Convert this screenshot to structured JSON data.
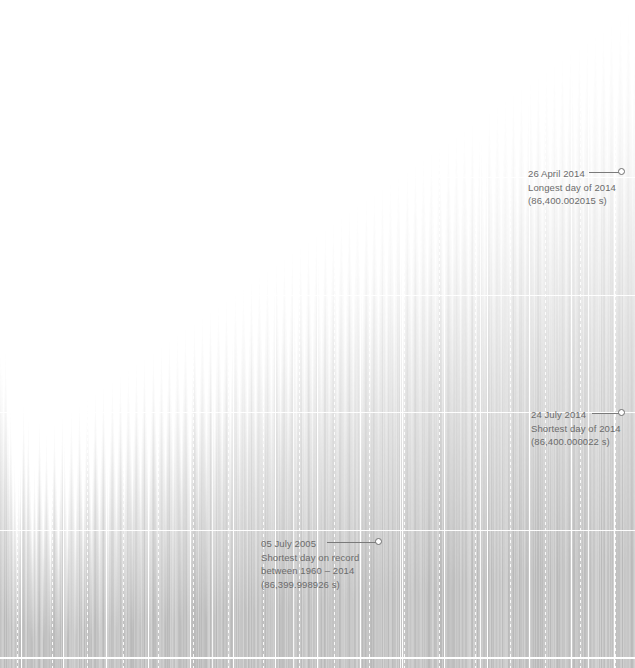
{
  "chart_data": {
    "type": "bar",
    "title": "",
    "subtitle": "",
    "xlabel": "",
    "ylabel": "",
    "xlim": [
      "1960",
      "2014"
    ],
    "ylim": [
      86399.9989,
      86400.0021
    ],
    "grid": true,
    "legend_position": "none",
    "units": "seconds",
    "baseline_value": 86400.0,
    "n_vertical_gridlines_solid": 6,
    "n_horizontal_gridlines": 4,
    "annotations": [
      {
        "id": "longest-day-2014",
        "date": "26 April 2014",
        "line1": "26 April 2014",
        "line2": "Longest day of 2014",
        "line3": "(86,400.002015 s)",
        "value": 86400.002015,
        "x": 622,
        "y": 172
      },
      {
        "id": "shortest-day-2014",
        "date": "24 July 2014",
        "line1": "24 July 2014",
        "line2": "Shortest day of 2014",
        "line3": "(86,400.000022 s)",
        "value": 86400.000022,
        "x": 622,
        "y": 413
      },
      {
        "id": "shortest-day-on-record",
        "date": "05 July 2005",
        "line1": "05 July 2005",
        "line2": "Shortest day on record",
        "line3": "between 1960 – 2014",
        "line4": "(86,399.998926 s)",
        "value": 86399.998926,
        "x": 379,
        "y": 542
      }
    ],
    "colors": {
      "bar": "#b9b9b9",
      "background": "#ffffff",
      "gridline": "#ffffff",
      "annotation_text": "#6b6b6b",
      "leader_line": "#7a7a7a"
    },
    "values": [
      318,
      306,
      300,
      268,
      288,
      322,
      296,
      258,
      246,
      220,
      262,
      236,
      202,
      174,
      212,
      188,
      150,
      164,
      198,
      176,
      206,
      232,
      268,
      244,
      212,
      190,
      228,
      252,
      214,
      190,
      164,
      142,
      178,
      206,
      180,
      154,
      196,
      224,
      250,
      226,
      198,
      170,
      146,
      184,
      212,
      238,
      210,
      182,
      154,
      130,
      168,
      196,
      224,
      248,
      222,
      194,
      166,
      138,
      176,
      204,
      232,
      256,
      230,
      202,
      174,
      146,
      184,
      212,
      240,
      262,
      236,
      208,
      180,
      152,
      190,
      218,
      246,
      268,
      242,
      214,
      186,
      158,
      196,
      224,
      252,
      274,
      248,
      220,
      192,
      164,
      202,
      230,
      258,
      280,
      254,
      226,
      198,
      170,
      208,
      236,
      264,
      286,
      260,
      232,
      204,
      176,
      214,
      242,
      270,
      292,
      266,
      238,
      210,
      182,
      220,
      248,
      276,
      298,
      272,
      244,
      216,
      188,
      226,
      254,
      282,
      304,
      278,
      250,
      222,
      194,
      232,
      260,
      288,
      310,
      284,
      256,
      228,
      200,
      238,
      266,
      294,
      316,
      290,
      262,
      234,
      206,
      244,
      272,
      300,
      322,
      296,
      268,
      240,
      212,
      250,
      278,
      306,
      328,
      302,
      274,
      246,
      218,
      256,
      284,
      312,
      334,
      308,
      280,
      252,
      224,
      262,
      290,
      318,
      340,
      314,
      286,
      258,
      230,
      268,
      296,
      324,
      346,
      320,
      292,
      264,
      236,
      274,
      302,
      330,
      352,
      326,
      298,
      270,
      242,
      280,
      308,
      336,
      358,
      332,
      304,
      276,
      248,
      286,
      314,
      342,
      364,
      338,
      310,
      282,
      254,
      292,
      320,
      348,
      370,
      344,
      316,
      288,
      260,
      298,
      326,
      354,
      376,
      350,
      322,
      294,
      266,
      304,
      332,
      360,
      382,
      356,
      328,
      300,
      272,
      310,
      338,
      366,
      388,
      362,
      334,
      306,
      278,
      316,
      344,
      372,
      394,
      368,
      340,
      312,
      284,
      322,
      350,
      378,
      400,
      374,
      346,
      318,
      290,
      328,
      356,
      384,
      406,
      380,
      352,
      324,
      296,
      334,
      362,
      390,
      412,
      386,
      358,
      330,
      302,
      340,
      368,
      396,
      418,
      392,
      364,
      336,
      308,
      346,
      374,
      402,
      424,
      398,
      370,
      342,
      314,
      352,
      380,
      408,
      430,
      404,
      376,
      348,
      320,
      358,
      386,
      414,
      436,
      410,
      382,
      354,
      326,
      364,
      392,
      420,
      442,
      416,
      388,
      360,
      332,
      370,
      398,
      426,
      448,
      422,
      394,
      366,
      338,
      376,
      404,
      432,
      454,
      428,
      400,
      372,
      344,
      382,
      410,
      438,
      460,
      434,
      406,
      378,
      350,
      388,
      416,
      444,
      466,
      440,
      412,
      384,
      356,
      394,
      422,
      450,
      472,
      446,
      418,
      390,
      362,
      400,
      428,
      456,
      478,
      452,
      424,
      396,
      368,
      406,
      434,
      462,
      484,
      458,
      430,
      402,
      374,
      412,
      440,
      468,
      490,
      464,
      436,
      408,
      380,
      418,
      446,
      474,
      496,
      470,
      442,
      414,
      386,
      424,
      452,
      480,
      502,
      476,
      448,
      420,
      392,
      430,
      458,
      486,
      508,
      482,
      454,
      426,
      398,
      436,
      464,
      492,
      514,
      488,
      460,
      432,
      404,
      442,
      470,
      498,
      520,
      494,
      466,
      438,
      410,
      448,
      476,
      504,
      526,
      500,
      472,
      444,
      416,
      454,
      482,
      510,
      532,
      506,
      478,
      450,
      422,
      460,
      488,
      516,
      538,
      512,
      484,
      456,
      428,
      466,
      494,
      522,
      544,
      518,
      490,
      462,
      434,
      472,
      500,
      528,
      550,
      524,
      496,
      468,
      440,
      478,
      506,
      534,
      556,
      530,
      502,
      474,
      446,
      484,
      512,
      540,
      562,
      536,
      508,
      480,
      452,
      490,
      518,
      546,
      568,
      542,
      514,
      486,
      458,
      496,
      524,
      552,
      574,
      548,
      520,
      492,
      464,
      502,
      530,
      558,
      580,
      554,
      526,
      498,
      470,
      508,
      536,
      564,
      586,
      560,
      532,
      504,
      476,
      514,
      542,
      570,
      592,
      566,
      538,
      510,
      482,
      520,
      548,
      576,
      598,
      572,
      544,
      516,
      488,
      526,
      554,
      582,
      604,
      578,
      550,
      522,
      494,
      532,
      560,
      588,
      610,
      584,
      556,
      528,
      500,
      538,
      566,
      594,
      616,
      590,
      562,
      534,
      506,
      544,
      572,
      600,
      622,
      596,
      568,
      540,
      512,
      550,
      578,
      606,
      628,
      602,
      574,
      546,
      518,
      556,
      584,
      612,
      634,
      608,
      580,
      552,
      524,
      562,
      590,
      618,
      640,
      614,
      586,
      558,
      530,
      568,
      596,
      624,
      646,
      620,
      592,
      564,
      536,
      574,
      602,
      630,
      652,
      626,
      598,
      570,
      542,
      580,
      608,
      636,
      658,
      632,
      604,
      576,
      548,
      586,
      614,
      642,
      664,
      638,
      610,
      582,
      554,
      592,
      620,
      648,
      670,
      644,
      616,
      588,
      560,
      598,
      626
    ]
  }
}
